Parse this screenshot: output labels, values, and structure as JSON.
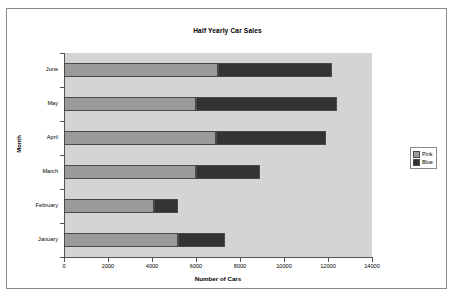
{
  "chart_data": {
    "type": "bar",
    "orientation": "horizontal",
    "stacked": true,
    "title": "Half Yearly Car Sales",
    "xlabel": "Number of Cars",
    "ylabel": "Month",
    "categories": [
      "January",
      "February",
      "March",
      "April",
      "May",
      "June"
    ],
    "categories_display_order_top_to_bottom": [
      "June",
      "May",
      "April",
      "March",
      "February",
      "January"
    ],
    "series": [
      {
        "name": "Pink",
        "color": "#9a9a9a",
        "values": [
          5200,
          4100,
          6000,
          6900,
          6000,
          7000
        ]
      },
      {
        "name": "Blue",
        "color": "#333333",
        "values": [
          2100,
          1100,
          2900,
          5000,
          6400,
          5200
        ]
      }
    ],
    "totals": [
      7300,
      5200,
      8900,
      11900,
      12400,
      12200
    ],
    "xlim": [
      0,
      14000
    ],
    "xticks": [
      0,
      2000,
      4000,
      6000,
      8000,
      10000,
      12000,
      14000
    ],
    "xtick_labels": [
      "0",
      "2000",
      "4000",
      "6000",
      "8000",
      "10000",
      "12000",
      "14000"
    ],
    "grid": false,
    "legend_position": "right",
    "plot_background": "#d4d4d4",
    "chart_background": "#ffffff"
  },
  "legend": {
    "entries": [
      {
        "label": "Pink"
      },
      {
        "label": "Blue"
      }
    ]
  }
}
